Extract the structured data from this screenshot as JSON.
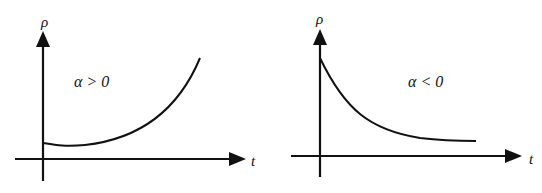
{
  "panels": [
    {
      "id": "left",
      "y_label": "ρ",
      "x_label": "t",
      "annotation": "α > 0",
      "curve": "increasing (exponential growth, slight dip near origin)"
    },
    {
      "id": "right",
      "y_label": "ρ",
      "x_label": "t",
      "annotation": "α < 0",
      "curve": "decreasing (exponential decay toward asymptote)"
    }
  ],
  "colors": {
    "ink": "#111111",
    "background": "#ffffff"
  }
}
